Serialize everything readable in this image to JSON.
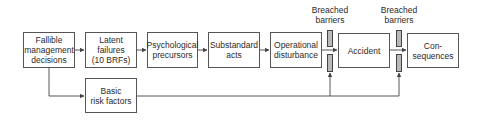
{
  "diagram": {
    "boxes": [
      {
        "id": "fallible-management-decisions",
        "label": "Fallible\nmanagement\ndecisions"
      },
      {
        "id": "latent-failures",
        "label": "Latent\nfailures\n(10 BRFs)"
      },
      {
        "id": "psychological-precursors",
        "label": "Psychological\nprecursors"
      },
      {
        "id": "substandard-acts",
        "label": "Substandard\nacts"
      },
      {
        "id": "operational-disturbance",
        "label": "Operational\ndisturbance"
      },
      {
        "id": "accident",
        "label": "Accident"
      },
      {
        "id": "consequences",
        "label": "Con-\nsequences"
      },
      {
        "id": "basic-risk-factors",
        "label": "Basic\nrisk factors"
      }
    ],
    "barrier_labels": [
      {
        "label": "Breached\nbarriers"
      },
      {
        "label": "Breached\nbarriers"
      }
    ],
    "colors": {
      "line": "#444444",
      "barrier_fill": "#b9b9b9",
      "box_border": "#555555"
    }
  }
}
